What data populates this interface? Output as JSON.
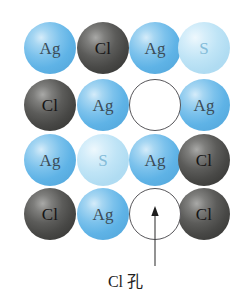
{
  "figure": {
    "type": "crystal-lattice-diagram",
    "background_color": "#ffffff",
    "grid": {
      "rows": 4,
      "columns": 4,
      "sphere_diameter_px": 52
    }
  },
  "species": {
    "ag": {
      "symbol": "Ag",
      "color": "#63b4e4",
      "label_color": "#3c4c57"
    },
    "cl": {
      "symbol": "Cl",
      "color": "#434341",
      "label_color": "#151515"
    },
    "s": {
      "symbol": "S",
      "color": "#aedaf1",
      "label_color": "#84bcd9"
    },
    "vacancy": {
      "symbol": "",
      "color": "#ffffff",
      "outline_color": "#57565a"
    }
  },
  "lattice": {
    "rows": [
      {
        "index": 0,
        "cells": [
          {
            "species": "ag",
            "symbol": "Ag",
            "x": 24,
            "y": 22
          },
          {
            "species": "cl",
            "symbol": "Cl",
            "x": 77,
            "y": 22
          },
          {
            "species": "ag",
            "symbol": "Ag",
            "x": 129,
            "y": 22
          },
          {
            "species": "s",
            "symbol": "S",
            "x": 178,
            "y": 22
          }
        ]
      },
      {
        "index": 1,
        "cells": [
          {
            "species": "cl",
            "symbol": "Cl",
            "x": 24,
            "y": 79
          },
          {
            "species": "ag",
            "symbol": "Ag",
            "x": 77,
            "y": 79
          },
          {
            "species": "vacancy",
            "symbol": "",
            "x": 129,
            "y": 79
          },
          {
            "species": "ag",
            "symbol": "Ag",
            "x": 178,
            "y": 79
          }
        ]
      },
      {
        "index": 2,
        "cells": [
          {
            "species": "ag",
            "symbol": "Ag",
            "x": 24,
            "y": 134
          },
          {
            "species": "s",
            "symbol": "S",
            "x": 77,
            "y": 134
          },
          {
            "species": "ag",
            "symbol": "Ag",
            "x": 129,
            "y": 134
          },
          {
            "species": "cl",
            "symbol": "Cl",
            "x": 178,
            "y": 134
          }
        ]
      },
      {
        "index": 3,
        "cells": [
          {
            "species": "cl",
            "symbol": "Cl",
            "x": 24,
            "y": 188
          },
          {
            "species": "ag",
            "symbol": "Ag",
            "x": 77,
            "y": 188
          },
          {
            "species": "vacancy",
            "symbol": "",
            "x": 129,
            "y": 188
          },
          {
            "species": "cl",
            "symbol": "Cl",
            "x": 178,
            "y": 188
          }
        ]
      }
    ]
  },
  "annotation": {
    "caption": "Cl 孔",
    "arrow": {
      "from_x": 155,
      "from_y": 266,
      "to_x": 155,
      "to_y": 207,
      "color": "#3a3a3a"
    },
    "caption_x": 155,
    "caption_y": 270
  }
}
